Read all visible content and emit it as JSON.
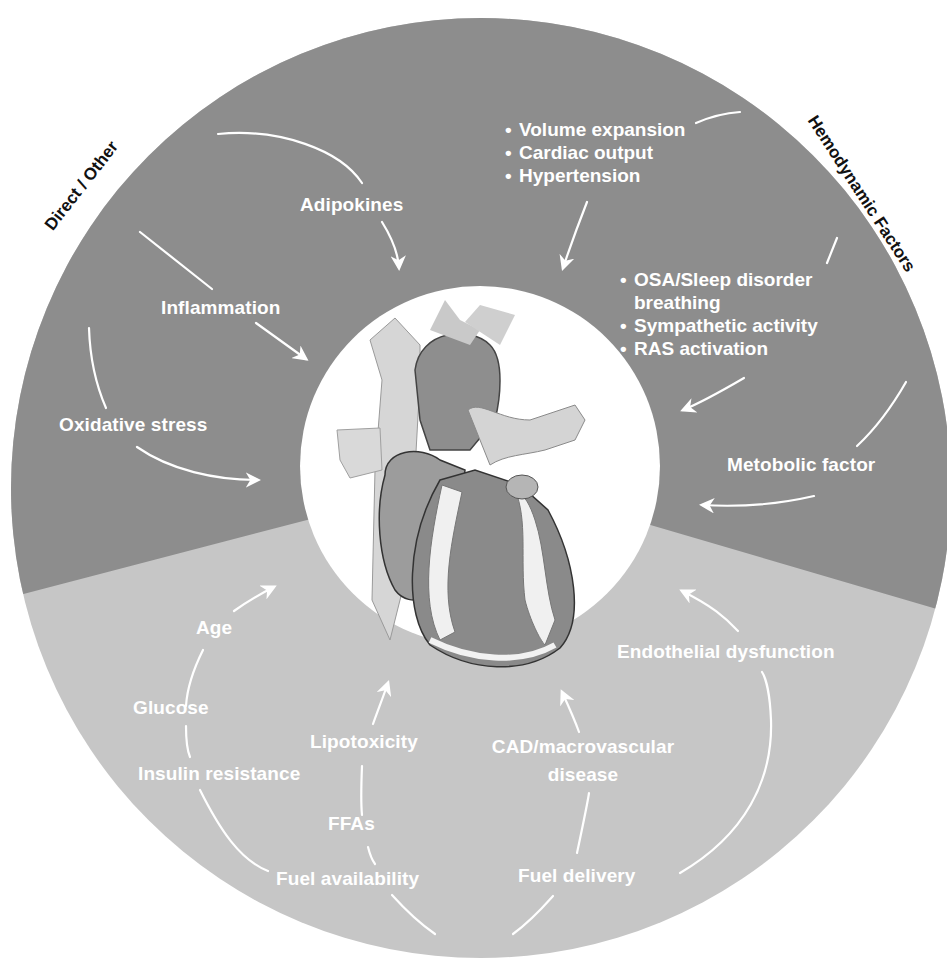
{
  "figure": {
    "colors": {
      "upper_region": "#8d8d8d",
      "lower_region": "#c6c6c6",
      "center_circle": "#ffffff",
      "text_labels": "#ffffff",
      "category_labels": "#111111"
    },
    "center_image": "heart-illustration",
    "categories": {
      "direct_other": "Direct / Other",
      "hemodynamic": "Hemodynamic Factors"
    },
    "upper_left": {
      "adipokines": "Adipokines",
      "inflammation": "Inflammation",
      "oxidative_stress": "Oxidative stress"
    },
    "upper_right": {
      "hemo_list": [
        "Volume expansion",
        "Cardiac output",
        "Hypertension"
      ],
      "osa_list": [
        "OSA/Sleep disorder",
        "breathing",
        "Sympathetic activity",
        "RAS activation"
      ],
      "metabolic": "Metobolic factor"
    },
    "lower_left": {
      "age": "Age",
      "glucose": "Glucose",
      "insulin_resistance": "Insulin resistance",
      "lipotoxicity": "Lipotoxicity",
      "ffas": "FFAs",
      "fuel_availability": "Fuel availability"
    },
    "lower_right": {
      "endothelial": "Endothelial dysfunction",
      "cad_line1": "CAD/macrovascular",
      "cad_line2": "disease",
      "fuel_delivery": "Fuel delivery"
    }
  }
}
